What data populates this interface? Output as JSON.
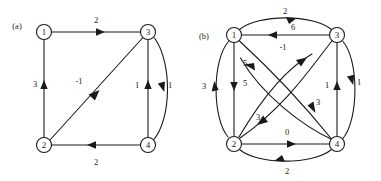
{
  "figure": {
    "kind": "directed-graph-figure",
    "background": "#ffffff",
    "ink_color": "#1a1a1a",
    "panels": [
      {
        "id": "a",
        "label": "(a)",
        "label_pos": {
          "x": 17,
          "y": 27
        },
        "nodes": [
          {
            "id": "n1",
            "label": "1",
            "cx": 44,
            "cy": 32,
            "r": 7.5
          },
          {
            "id": "n3",
            "label": "3",
            "cx": 148,
            "cy": 32,
            "r": 7.5
          },
          {
            "id": "n2",
            "label": "2",
            "cx": 44,
            "cy": 145,
            "r": 7.5
          },
          {
            "id": "n4",
            "label": "4",
            "cx": 148,
            "cy": 145,
            "r": 7.5
          }
        ],
        "edges": [
          {
            "from": "1",
            "to": "3",
            "weight": "2",
            "shape": "straight",
            "label_pos": {
              "x": 96,
              "y": 21
            }
          },
          {
            "from": "2",
            "to": "1",
            "weight": "3",
            "shape": "straight",
            "label_pos": {
              "x": 35,
              "y": 85
            }
          },
          {
            "from": "2",
            "to": "3",
            "weight": "-1",
            "shape": "straight",
            "label_pos": {
              "x": 79,
              "y": 82
            }
          },
          {
            "from": "4",
            "to": "3",
            "weight": "1",
            "shape": "straight",
            "label_pos": {
              "x": 137,
              "y": 86
            }
          },
          {
            "from": "3",
            "to": "4",
            "weight": "1",
            "shape": "curved",
            "label_pos": {
              "x": 170,
              "y": 86
            }
          },
          {
            "from": "4",
            "to": "2",
            "weight": "2",
            "shape": "straight",
            "label_pos": {
              "x": 96,
              "y": 163
            }
          }
        ]
      },
      {
        "id": "b",
        "label": "(b)",
        "label_pos": {
          "x": 204,
          "y": 37
        },
        "nodes": [
          {
            "id": "n1",
            "label": "1",
            "cx": 234,
            "cy": 35,
            "r": 7.5
          },
          {
            "id": "n3",
            "label": "3",
            "cx": 337,
            "cy": 35,
            "r": 7.5
          },
          {
            "id": "n2",
            "label": "2",
            "cx": 234,
            "cy": 144,
            "r": 7.5
          },
          {
            "id": "n4",
            "label": "4",
            "cx": 337,
            "cy": 144,
            "r": 7.5
          }
        ],
        "edges": [
          {
            "from": "1",
            "to": "3",
            "weight": "2",
            "shape": "curved",
            "label_pos": {
              "x": 285,
              "y": 12
            }
          },
          {
            "from": "3",
            "to": "1",
            "weight": "6",
            "shape": "straight",
            "label_pos": {
              "x": 293,
              "y": 28
            }
          },
          {
            "from": "2",
            "to": "1",
            "weight": "3",
            "shape": "curved",
            "label_pos": {
              "x": 204,
              "y": 87
            }
          },
          {
            "from": "1",
            "to": "2",
            "weight": "5",
            "shape": "straight",
            "label_pos": {
              "x": 245,
              "y": 84
            }
          },
          {
            "from": "4",
            "to": "1",
            "weight": "5",
            "shape": "curved",
            "label_pos": {
              "x": 245,
              "y": 64
            }
          },
          {
            "from": "2",
            "to": "3",
            "weight": "-1",
            "shape": "curved",
            "label_pos": {
              "x": 283,
              "y": 48
            }
          },
          {
            "from": "1",
            "to": "4",
            "weight": "3",
            "shape": "curved",
            "label_pos": {
              "x": 318,
              "y": 103
            }
          },
          {
            "from": "3",
            "to": "2",
            "weight": "3",
            "shape": "curved",
            "label_pos": {
              "x": 258,
              "y": 118
            }
          },
          {
            "from": "4",
            "to": "3",
            "weight": "1",
            "shape": "straight",
            "label_pos": {
              "x": 327,
              "y": 86
            }
          },
          {
            "from": "3",
            "to": "4",
            "weight": "1",
            "shape": "curved",
            "label_pos": {
              "x": 359,
              "y": 83
            }
          },
          {
            "from": "2",
            "to": "4",
            "weight": "0",
            "shape": "straight",
            "label_pos": {
              "x": 287,
              "y": 133
            }
          },
          {
            "from": "4",
            "to": "2",
            "weight": "2",
            "shape": "curved",
            "label_pos": {
              "x": 287,
              "y": 172
            }
          }
        ]
      }
    ],
    "panel_a_weights": [
      "2",
      "3",
      "-1",
      "1",
      "1",
      "2"
    ],
    "panel_b_weights": [
      "2",
      "6",
      "3",
      "5",
      "5",
      "-1",
      "3",
      "3",
      "1",
      "1",
      "0",
      "2"
    ]
  }
}
